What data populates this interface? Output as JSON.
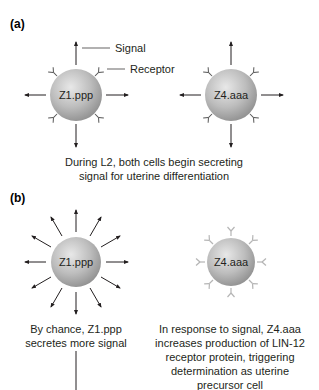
{
  "panel_a": {
    "label": "(a)",
    "cell_left": {
      "name": "Z1.ppp"
    },
    "cell_right": {
      "name": "Z4.aaa"
    },
    "callouts": {
      "signal": "Signal",
      "receptor": "Receptor"
    },
    "caption": {
      "line1": "During L2, both cells begin secreting",
      "line2": "signal for uterine differentiation"
    }
  },
  "panel_b": {
    "label": "(b)",
    "cell_left": {
      "name": "Z1.ppp",
      "caption": {
        "line1": "By chance, Z1.ppp",
        "line2": "secretes more signal"
      }
    },
    "cell_right": {
      "name": "Z4.aaa",
      "caption": {
        "line1": "In response to signal, Z4.aaa",
        "line2": "increases production of LIN-12",
        "line3": "receptor protein, triggering",
        "line4": "determination as uterine",
        "line5": "precursor cell"
      }
    }
  },
  "colors": {
    "cell_light": "#e6e6e6",
    "cell_dark": "#8c8c8c",
    "arrow": "#231f20",
    "receptor_dark": "#555555",
    "receptor_light": "#b5b5b5"
  }
}
